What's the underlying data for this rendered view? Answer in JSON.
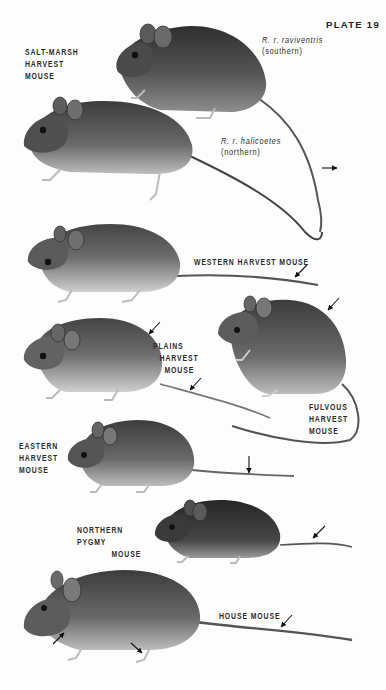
{
  "page": {
    "plate_number": "PLATE 19",
    "background": "#fdfdfd",
    "ink_color": "#2b2b2b"
  },
  "species": [
    {
      "id": "salt-marsh-harvest-mouse",
      "name_lines": [
        "SALT-MARSH",
        "HARVEST",
        "MOUSE"
      ],
      "subspecies": [
        {
          "italic": "R. r. raviventris",
          "plain": "(southern)"
        },
        {
          "italic": "R. r. halicoetes",
          "plain": "(northern)"
        }
      ]
    },
    {
      "id": "western-harvest-mouse",
      "name_lines": [
        "WESTERN HARVEST MOUSE"
      ]
    },
    {
      "id": "plains-harvest-mouse",
      "name_lines": [
        "PLAINS",
        "HARVEST",
        "MOUSE"
      ]
    },
    {
      "id": "fulvous-harvest-mouse",
      "name_lines": [
        "FULVOUS",
        "HARVEST",
        "MOUSE"
      ]
    },
    {
      "id": "eastern-harvest-mouse",
      "name_lines": [
        "EASTERN",
        "HARVEST",
        "MOUSE"
      ]
    },
    {
      "id": "northern-pygmy-mouse",
      "name_lines": [
        "NORTHERN PYGMY",
        "MOUSE"
      ]
    },
    {
      "id": "house-mouse",
      "name_lines": [
        "HOUSE MOUSE"
      ]
    }
  ],
  "colors": {
    "fur_dark": "#3a3a3a",
    "fur_mid": "#5e5e5e",
    "fur_light": "#8a8a8a",
    "belly": "#d9d9d9",
    "feet": "#cfcfcf",
    "arrow": "#111111"
  }
}
